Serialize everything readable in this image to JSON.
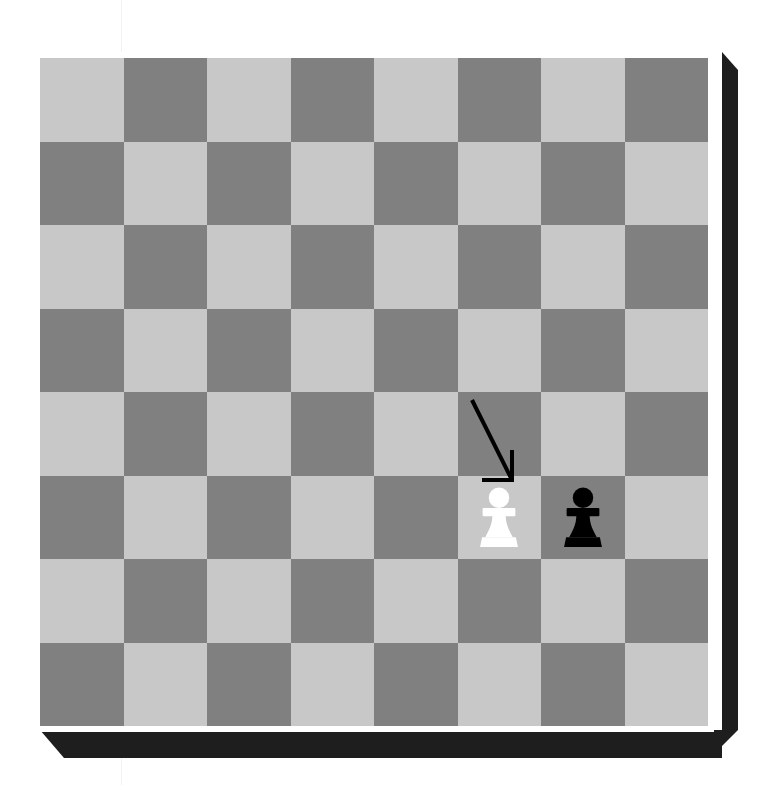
{
  "scene": {
    "title": "Chess Board Capture Diagram",
    "width": 779,
    "height": 785,
    "background_color": "#ffffff"
  },
  "board": {
    "name": "chess-board",
    "files": 8,
    "ranks": 8,
    "origin_x": 40,
    "origin_y": 58,
    "size_px": 668,
    "square_px": 83.5,
    "light_square_color": "#c8c8c8",
    "dark_square_color": "#808080",
    "top_left_square_shade": "light",
    "rim_color": "#ffffff",
    "edge_color": "#1e1e1e",
    "edge_depth_px": 28,
    "coordinate_labels_visible": false
  },
  "pieces": [
    {
      "id": "white-pawn",
      "type": "pawn",
      "color": "white",
      "color_hex": "#ffffff",
      "col": 5,
      "row": 5,
      "square_shade": "light",
      "label": "White pawn"
    },
    {
      "id": "black-pawn",
      "type": "pawn",
      "color": "black",
      "color_hex": "#000000",
      "col": 6,
      "row": 5,
      "square_shade": "dark",
      "label": "Black pawn"
    }
  ],
  "annotations": {
    "move_arrow": {
      "name": "move-arrow",
      "label": "Capture move arrow",
      "color": "#000000",
      "stroke_width": 4,
      "start_col": 5,
      "start_row": 4,
      "from_x": 432,
      "from_y": 342,
      "to_x": 472,
      "to_y": 422,
      "head_style": "open-barb",
      "head_size": 30,
      "direction": "down-right"
    }
  },
  "artifact": {
    "name": "scan-line",
    "x": 121,
    "color": "#f2f2f2",
    "visible": true
  }
}
